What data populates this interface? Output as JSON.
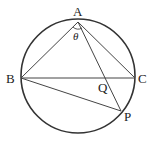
{
  "figure": {
    "type": "circle-inscribed-geometry",
    "stroke_color": "#333333",
    "points": {
      "A": {
        "label": "A"
      },
      "B": {
        "label": "B"
      },
      "C": {
        "label": "C"
      },
      "P": {
        "label": "P"
      },
      "Q": {
        "label": "Q"
      }
    },
    "angle_label": "θ",
    "segments": [
      "AB",
      "AC",
      "BC",
      "AP",
      "BP"
    ]
  }
}
